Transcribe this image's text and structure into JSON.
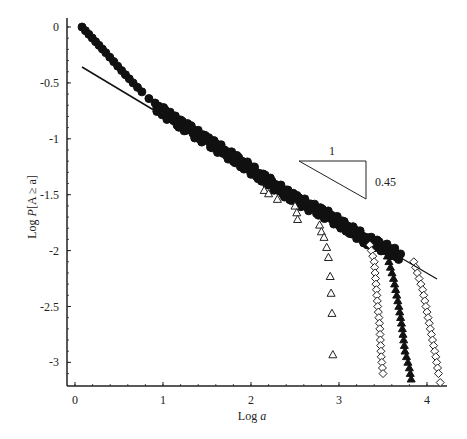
{
  "chart_data": {
    "type": "scatter",
    "title": "",
    "xlabel": "Log a",
    "ylabel": "Log P[A ≥ a]",
    "xlim": [
      -0.1,
      4.3
    ],
    "ylim": [
      -3.2,
      0.05
    ],
    "x_ticks": [
      "0",
      "1",
      "2",
      "3",
      "4"
    ],
    "y_ticks": [
      "0",
      "-0.5",
      "-1",
      "-1.5",
      "-2",
      "-2.5",
      "-3"
    ],
    "grid": false,
    "legend": null,
    "annotations": {
      "slope_triangle": {
        "run_label": "1",
        "rise_label": "0.45"
      },
      "fit_line": {
        "slope": -0.45,
        "from": [
          0.08,
          -0.36
        ],
        "to": [
          4.1,
          -2.25
        ]
      }
    },
    "series": [
      {
        "name": "filled-pentagons (main body)",
        "marker": "filled-pentagon",
        "points": [
          [
            0.08,
            0.0
          ],
          [
            0.35,
            -0.23
          ],
          [
            0.53,
            -0.39
          ],
          [
            0.66,
            -0.5
          ],
          [
            0.76,
            -0.58
          ],
          [
            0.84,
            -0.64
          ],
          [
            0.91,
            -0.68
          ],
          [
            0.97,
            -0.72
          ],
          [
            1.1,
            -0.8
          ],
          [
            1.3,
            -0.9
          ],
          [
            1.5,
            -1.0
          ],
          [
            1.7,
            -1.1
          ],
          [
            1.9,
            -1.2
          ],
          [
            2.1,
            -1.31
          ],
          [
            2.3,
            -1.42
          ],
          [
            2.5,
            -1.52
          ],
          [
            2.7,
            -1.6
          ],
          [
            2.9,
            -1.68
          ],
          [
            3.1,
            -1.78
          ],
          [
            3.3,
            -1.88
          ],
          [
            3.5,
            -1.95
          ],
          [
            3.7,
            -2.03
          ]
        ]
      },
      {
        "name": "open-triangles",
        "marker": "open-triangle",
        "points": [
          [
            2.15,
            -1.46
          ],
          [
            2.2,
            -1.49
          ],
          [
            2.3,
            -1.54
          ],
          [
            2.5,
            -1.6
          ],
          [
            2.52,
            -1.66
          ],
          [
            2.53,
            -1.72
          ],
          [
            2.78,
            -1.77
          ],
          [
            2.8,
            -1.83
          ],
          [
            2.83,
            -1.88
          ],
          [
            2.86,
            -1.97
          ],
          [
            2.88,
            -2.06
          ],
          [
            2.9,
            -2.23
          ],
          [
            2.91,
            -2.38
          ],
          [
            2.92,
            -2.56
          ],
          [
            2.93,
            -2.93
          ]
        ]
      },
      {
        "name": "open-diamonds",
        "marker": "open-diamond",
        "points": [
          [
            3.35,
            -1.95
          ],
          [
            3.4,
            -2.1
          ],
          [
            3.42,
            -2.3
          ],
          [
            3.44,
            -2.5
          ],
          [
            3.46,
            -2.65
          ],
          [
            3.47,
            -2.8
          ],
          [
            3.48,
            -2.95
          ],
          [
            3.5,
            -3.1
          ]
        ]
      },
      {
        "name": "filled-stars",
        "marker": "filled-star",
        "points": [
          [
            3.55,
            -2.05
          ],
          [
            3.62,
            -2.25
          ],
          [
            3.68,
            -2.5
          ],
          [
            3.72,
            -2.7
          ],
          [
            3.75,
            -2.9
          ],
          [
            3.8,
            -3.05
          ],
          [
            3.82,
            -3.15
          ]
        ]
      },
      {
        "name": "open-diamonds-tail",
        "marker": "open-diamond",
        "points": [
          [
            3.85,
            -2.1
          ],
          [
            3.95,
            -2.35
          ],
          [
            4.0,
            -2.55
          ],
          [
            4.05,
            -2.75
          ],
          [
            4.1,
            -2.95
          ],
          [
            4.13,
            -3.1
          ],
          [
            4.15,
            -3.18
          ]
        ]
      }
    ]
  }
}
